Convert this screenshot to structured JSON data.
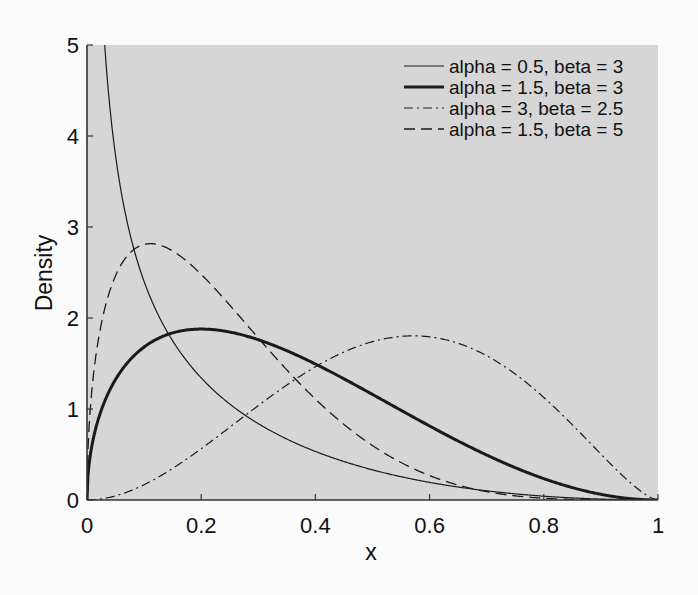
{
  "chart_data": {
    "type": "line",
    "title": "",
    "xlabel": "x",
    "ylabel": "Density",
    "xlim": [
      0,
      1
    ],
    "ylim": [
      0,
      5
    ],
    "grid": false,
    "legend_position": "upper right",
    "x_ticks": [
      "0",
      "0.2",
      "0.4",
      "0.6",
      "0.8",
      "1"
    ],
    "y_ticks": [
      "0",
      "1",
      "2",
      "3",
      "4",
      "5"
    ],
    "series": [
      {
        "name": "alpha = 0.5, beta = 3",
        "alpha": 0.5,
        "beta": 3,
        "style": "thin-solid",
        "values_at_x": {
          "x": [
            0.05,
            0.1,
            0.2,
            0.4,
            0.6,
            0.8,
            1.0
          ],
          "y": [
            3.79,
            2.4,
            1.33,
            0.53,
            0.19,
            0.03,
            0.0
          ]
        }
      },
      {
        "name": "alpha = 1.5, beta = 3",
        "alpha": 1.5,
        "beta": 3,
        "style": "thick-solid",
        "values_at_x": {
          "x": [
            0.05,
            0.1,
            0.2,
            0.4,
            0.6,
            0.8,
            1.0
          ],
          "y": [
            1.33,
            1.68,
            1.88,
            1.5,
            0.81,
            0.24,
            0.0
          ]
        }
      },
      {
        "name": "alpha = 3, beta = 2.5",
        "alpha": 3,
        "beta": 2.5,
        "style": "dash-dot",
        "values_at_x": {
          "x": [
            0.1,
            0.2,
            0.4,
            0.6,
            0.7,
            0.8,
            0.9,
            1.0
          ],
          "y": [
            0.17,
            0.57,
            1.46,
            1.78,
            1.84,
            1.76,
            1.25,
            0.0
          ]
        }
      },
      {
        "name": "alpha = 1.5, beta = 5",
        "alpha": 1.5,
        "beta": 5,
        "style": "dashed",
        "values_at_x": {
          "x": [
            0.05,
            0.1,
            0.12,
            0.2,
            0.4,
            0.6,
            0.8,
            1.0
          ],
          "y": [
            2.47,
            2.69,
            2.7,
            2.48,
            1.11,
            0.27,
            0.02,
            0.0
          ]
        }
      }
    ]
  },
  "colors": {
    "plot_background": "#d6d6d6",
    "page_background": "#fbfbfb",
    "line": "#1a1a1a"
  }
}
